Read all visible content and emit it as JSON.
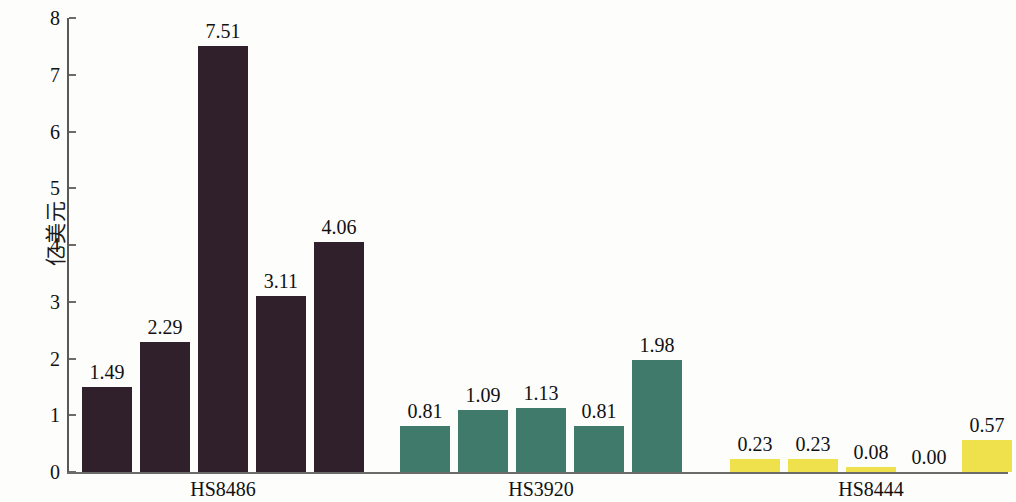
{
  "chart_data": {
    "type": "bar",
    "title": "",
    "xlabel": "",
    "ylabel": "亿美元",
    "ylim": [
      0,
      8
    ],
    "yticks": [
      "0",
      "1",
      "2",
      "3",
      "4",
      "5",
      "6",
      "7",
      "8"
    ],
    "grid": false,
    "legend": "none",
    "categories": [
      "HS8486",
      "HS3920",
      "HS8444"
    ],
    "groups": [
      {
        "name": "HS8486",
        "color": "#2f202b",
        "values": [
          1.49,
          2.29,
          7.51,
          3.11,
          4.06
        ],
        "labels": [
          "1.49",
          "2.29",
          "7.51",
          "3.11",
          "4.06"
        ]
      },
      {
        "name": "HS3920",
        "color": "#3f7a6b",
        "values": [
          0.81,
          1.09,
          1.13,
          0.81,
          1.98
        ],
        "labels": [
          "0.81",
          "1.09",
          "1.13",
          "0.81",
          "1.98"
        ]
      },
      {
        "name": "HS8444",
        "color": "#efe14b",
        "values": [
          0.23,
          0.23,
          0.08,
          0.0,
          0.57
        ],
        "labels": [
          "0.23",
          "0.23",
          "0.08",
          "0.00",
          "0.57"
        ]
      }
    ]
  }
}
